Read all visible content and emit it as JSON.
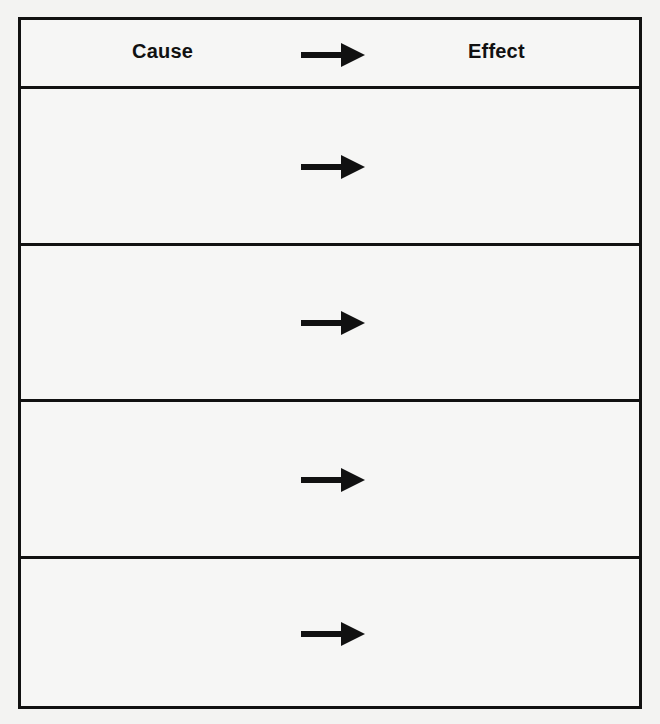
{
  "organizer": {
    "type": "cause-effect graphic organizer",
    "header": {
      "cause_label": "Cause",
      "effect_label": "Effect",
      "arrow_icon": "right-arrow-icon"
    },
    "rows": [
      {
        "cause": "",
        "effect": "",
        "arrow_icon": "right-arrow-icon"
      },
      {
        "cause": "",
        "effect": "",
        "arrow_icon": "right-arrow-icon"
      },
      {
        "cause": "",
        "effect": "",
        "arrow_icon": "right-arrow-icon"
      },
      {
        "cause": "",
        "effect": "",
        "arrow_icon": "right-arrow-icon"
      }
    ],
    "colors": {
      "border": "#111111",
      "background": "#f6f6f5",
      "text": "#111111"
    }
  }
}
